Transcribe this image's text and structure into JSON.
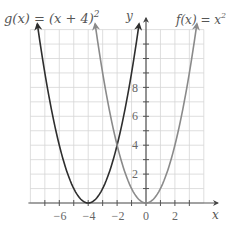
{
  "chart_data": {
    "type": "line",
    "title": "",
    "xlabel": "x",
    "ylabel": "y",
    "xlim": [
      -8,
      4
    ],
    "ylim": [
      0,
      12
    ],
    "grid": true,
    "x_ticks": [
      -6,
      -4,
      -2,
      0,
      2
    ],
    "y_ticks": [
      2,
      4,
      6,
      8
    ],
    "series": [
      {
        "name": "g(x) = (x + 4)^2",
        "label_main": "g(x) = (x + 4)",
        "label_sup": "2",
        "formula": "(x+4)^2",
        "vertex": [
          -4,
          0
        ],
        "color": "#2e2e2e"
      },
      {
        "name": "f(x) = x^2",
        "label_main": "f(x) = x",
        "label_sup": "2",
        "formula": "x^2",
        "vertex": [
          0,
          0
        ],
        "color": "#8a8a8a"
      }
    ],
    "annotations": [
      {
        "text": "intersection",
        "x": -2,
        "y": 4
      }
    ]
  },
  "labels": {
    "x_axis": "x",
    "y_axis": "y",
    "g_main": "g(x) = (x + 4)",
    "g_sup": "2",
    "f_main": "f(x) = x",
    "f_sup": "2",
    "xt0": "−6",
    "xt1": "−4",
    "xt2": "−2",
    "xt3": "0",
    "xt4": "2",
    "yt0": "2",
    "yt1": "4",
    "yt2": "6",
    "yt3": "8"
  }
}
